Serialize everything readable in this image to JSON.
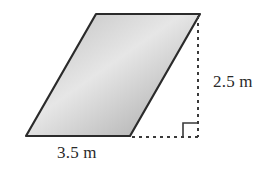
{
  "figure": {
    "shape": "parallelogram",
    "vertices": {
      "top_left": [
        96,
        14
      ],
      "top_right": [
        200,
        14
      ],
      "bottom_right": [
        130,
        136
      ],
      "bottom_left": [
        26,
        136
      ]
    },
    "fill_gradient": {
      "light": "#e8e8e8",
      "dark": "#a9a9a9"
    },
    "stroke_color": "#2b2b2b",
    "base_label": "3.5 m",
    "height_label": "2.5 m",
    "right_angle_marker": true
  }
}
